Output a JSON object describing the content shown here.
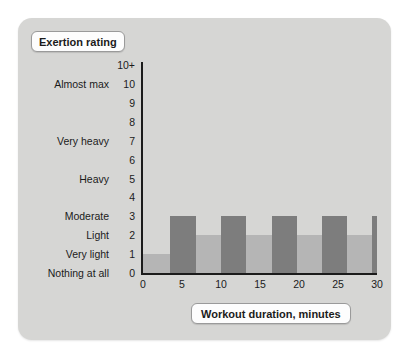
{
  "card": {
    "background_color": "#d6d6d4"
  },
  "y_axis_title": "Exertion rating",
  "x_axis_title": "Workout duration, minutes",
  "chart_data": {
    "type": "bar",
    "title": "",
    "subtitle": "",
    "xlabel": "Workout duration, minutes",
    "ylabel": "Exertion rating",
    "xlim": [
      0,
      30
    ],
    "ylim": [
      0,
      11
    ],
    "grid": false,
    "legend": null,
    "x_ticks": [
      0,
      5,
      10,
      15,
      20,
      25,
      30
    ],
    "x_tick_labels": [
      "0",
      "5",
      "10",
      "15",
      "20",
      "25",
      "30"
    ],
    "y_ticks": [
      0,
      1,
      2,
      3,
      4,
      5,
      6,
      7,
      8,
      9,
      10,
      11
    ],
    "y_tick_labels": [
      "0",
      "1",
      "2",
      "3",
      "4",
      "5",
      "6",
      "7",
      "8",
      "9",
      "10",
      "10+"
    ],
    "y_scale_descriptions": [
      {
        "value": 11,
        "number": "10+",
        "label": ""
      },
      {
        "value": 10,
        "number": "10",
        "label": "Almost max"
      },
      {
        "value": 9,
        "number": "9",
        "label": ""
      },
      {
        "value": 8,
        "number": "8",
        "label": ""
      },
      {
        "value": 7,
        "number": "7",
        "label": "Very heavy"
      },
      {
        "value": 6,
        "number": "6",
        "label": ""
      },
      {
        "value": 5,
        "number": "5",
        "label": "Heavy"
      },
      {
        "value": 4,
        "number": "4",
        "label": ""
      },
      {
        "value": 3,
        "number": "3",
        "label": "Moderate"
      },
      {
        "value": 2,
        "number": "2",
        "label": "Light"
      },
      {
        "value": 1,
        "number": "1",
        "label": "Very light"
      },
      {
        "value": 0,
        "number": "0",
        "label": "Nothing at all"
      }
    ],
    "series": [
      {
        "name": "Exertion",
        "intervals": [
          {
            "x_start": 0,
            "x_end": 3.5,
            "value": 1,
            "intensity": "warm-up",
            "color": "#b5b5b5"
          },
          {
            "x_start": 3.5,
            "x_end": 6.8,
            "value": 3,
            "intensity": "hard",
            "color": "#7d7d7d"
          },
          {
            "x_start": 6.8,
            "x_end": 10.0,
            "value": 2,
            "intensity": "easy",
            "color": "#b5b5b5"
          },
          {
            "x_start": 10.0,
            "x_end": 13.2,
            "value": 3,
            "intensity": "hard",
            "color": "#7d7d7d"
          },
          {
            "x_start": 13.2,
            "x_end": 16.5,
            "value": 2,
            "intensity": "easy",
            "color": "#b5b5b5"
          },
          {
            "x_start": 16.5,
            "x_end": 19.7,
            "value": 3,
            "intensity": "hard",
            "color": "#7d7d7d"
          },
          {
            "x_start": 19.7,
            "x_end": 22.9,
            "value": 2,
            "intensity": "easy",
            "color": "#b5b5b5"
          },
          {
            "x_start": 22.9,
            "x_end": 26.2,
            "value": 3,
            "intensity": "hard",
            "color": "#7d7d7d"
          },
          {
            "x_start": 26.2,
            "x_end": 29.4,
            "value": 2,
            "intensity": "easy",
            "color": "#b5b5b5"
          },
          {
            "x_start": 29.4,
            "x_end": 32.6,
            "value": 3,
            "intensity": "hard",
            "color": "#7d7d7d"
          }
        ]
      }
    ],
    "colors": {
      "hard_bar": "#7d7d7d",
      "easy_bar": "#b5b5b5",
      "axis": "#1b1b1b",
      "background": "#d6d6d4"
    }
  }
}
